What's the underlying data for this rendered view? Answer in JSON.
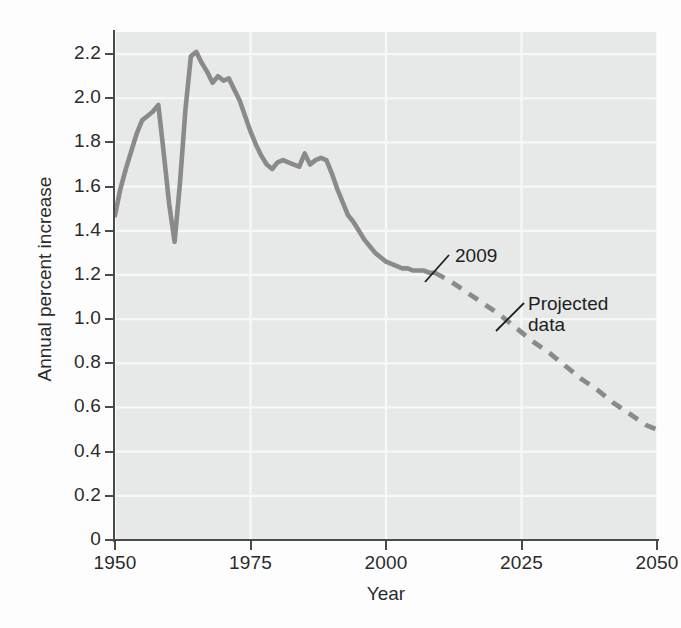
{
  "chart_data": {
    "type": "line",
    "title": "",
    "xlabel": "Year",
    "ylabel": "Annual percent increase",
    "xlim": [
      1950,
      2050
    ],
    "ylim": [
      0,
      2.3
    ],
    "grid": true,
    "legend": false,
    "xticks": [
      "1950",
      "1975",
      "2000",
      "2025",
      "2050"
    ],
    "xtick_values": [
      1950,
      1975,
      2000,
      2025,
      2050
    ],
    "yticks": [
      "0",
      "0.2",
      "0.4",
      "0.6",
      "0.8",
      "1.0",
      "1.2",
      "1.4",
      "1.6",
      "1.8",
      "2.0",
      "2.2"
    ],
    "ytick_values": [
      0,
      0.2,
      0.4,
      0.6,
      0.8,
      1.0,
      1.2,
      1.4,
      1.6,
      1.8,
      2.0,
      2.2
    ],
    "series": [
      {
        "name": "Observed data",
        "style": "solid",
        "color": "#8a8a8a",
        "x": [
          1950,
          1951,
          1952,
          1953,
          1954,
          1955,
          1956,
          1957,
          1958,
          1959,
          1960,
          1961,
          1962,
          1963,
          1964,
          1965,
          1966,
          1967,
          1968,
          1969,
          1970,
          1971,
          1972,
          1973,
          1974,
          1975,
          1976,
          1977,
          1978,
          1979,
          1980,
          1981,
          1982,
          1983,
          1984,
          1985,
          1986,
          1987,
          1988,
          1989,
          1990,
          1991,
          1992,
          1993,
          1994,
          1995,
          1996,
          1997,
          1998,
          1999,
          2000,
          2001,
          2002,
          2003,
          2004,
          2005,
          2006,
          2007,
          2008,
          2009
        ],
        "values": [
          1.47,
          1.59,
          1.68,
          1.76,
          1.84,
          1.9,
          1.92,
          1.94,
          1.97,
          1.75,
          1.52,
          1.35,
          1.62,
          1.95,
          2.19,
          2.21,
          2.16,
          2.12,
          2.07,
          2.1,
          2.08,
          2.09,
          2.04,
          1.99,
          1.92,
          1.85,
          1.79,
          1.74,
          1.7,
          1.68,
          1.71,
          1.72,
          1.71,
          1.7,
          1.69,
          1.75,
          1.7,
          1.72,
          1.73,
          1.72,
          1.66,
          1.59,
          1.53,
          1.47,
          1.44,
          1.4,
          1.36,
          1.33,
          1.3,
          1.28,
          1.26,
          1.25,
          1.24,
          1.23,
          1.23,
          1.22,
          1.22,
          1.22,
          1.21,
          1.21
        ]
      },
      {
        "name": "Projected data",
        "style": "dashed",
        "color": "#8a8a8a",
        "x": [
          2009,
          2012,
          2015,
          2018,
          2021,
          2024,
          2027,
          2030,
          2033,
          2036,
          2039,
          2042,
          2045,
          2048,
          2050
        ],
        "values": [
          1.21,
          1.17,
          1.12,
          1.07,
          1.02,
          0.96,
          0.9,
          0.85,
          0.79,
          0.73,
          0.68,
          0.62,
          0.57,
          0.52,
          0.5
        ]
      }
    ],
    "annotations": [
      {
        "name": "annotation-2009",
        "label": "2009",
        "points_to_x": 2009,
        "points_to_y": 1.21
      },
      {
        "name": "annotation-projected-data",
        "label": "Projected\ndata",
        "points_to_x": 2024,
        "points_to_y": 0.96
      }
    ],
    "colors": {
      "plot_background": "#e7e8e8",
      "gridline": "#f7f8f8",
      "axis": "#4a4a4a",
      "line": "#8a8a8a",
      "text": "#2b2b2b",
      "page_background": "#fdfdfd"
    }
  },
  "axis": {
    "y_title": "Annual percent increase",
    "x_title": "Year"
  }
}
